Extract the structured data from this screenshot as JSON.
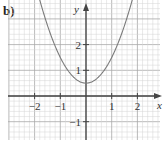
{
  "part_label": "b)",
  "chart_data": {
    "type": "line",
    "title": "",
    "function": "y = x^2 + 0.5",
    "xlabel": "x",
    "ylabel": "y",
    "xlim": [
      -2.9,
      3.0
    ],
    "ylim": [
      -1.7,
      3.7
    ],
    "x_ticks": [
      -2,
      -1,
      1,
      2
    ],
    "x_tick_labels": [
      "−2",
      "−1",
      "1",
      "2"
    ],
    "y_ticks": [
      2,
      1,
      -1
    ],
    "y_tick_labels": [
      "2",
      "1",
      "−1"
    ],
    "grid": true,
    "series": [
      {
        "name": "parabola",
        "x": [
          -1.7,
          -1.5,
          -1,
          -0.5,
          0,
          0.5,
          1,
          1.5,
          1.7
        ],
        "y": [
          3.39,
          2.75,
          1.5,
          0.75,
          0.5,
          0.75,
          1.5,
          2.75,
          3.39
        ]
      }
    ],
    "colors": {
      "grid_minor": "#d4d4d4",
      "grid_major": "#a8a8a8",
      "axis": "#444444",
      "curve": "#7a7a7a"
    }
  }
}
